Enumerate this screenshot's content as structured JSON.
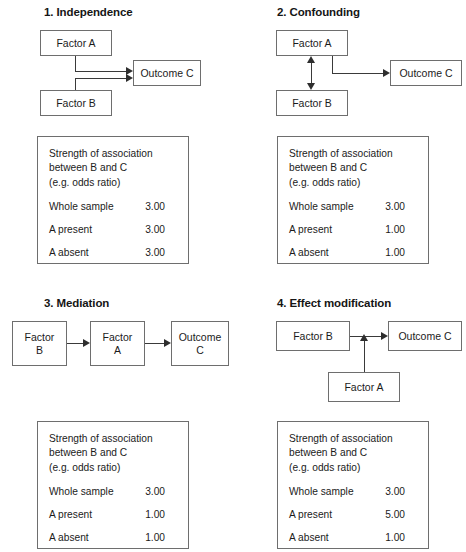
{
  "figure": {
    "panels": [
      {
        "title": "1. Independence",
        "nodes": {
          "factor_a": "Factor A",
          "factor_b": "Factor B",
          "outcome_c": "Outcome C"
        },
        "table": {
          "heading": "Strength of association\nbetween B and C\n(e.g. odds ratio)",
          "rows": [
            {
              "label": "Whole sample",
              "value": "3.00"
            },
            {
              "label": "A present",
              "value": "3.00"
            },
            {
              "label": "A absent",
              "value": "3.00"
            }
          ]
        }
      },
      {
        "title": "2. Confounding",
        "nodes": {
          "factor_a": "Factor A",
          "factor_b": "Factor B",
          "outcome_c": "Outcome C"
        },
        "table": {
          "heading": "Strength of association\nbetween B and C\n(e.g. odds ratio)",
          "rows": [
            {
              "label": "Whole sample",
              "value": "3.00"
            },
            {
              "label": "A present",
              "value": "1.00"
            },
            {
              "label": "A absent",
              "value": "1.00"
            }
          ]
        }
      },
      {
        "title": "3. Mediation",
        "nodes": {
          "factor_b_line1": "Factor",
          "factor_b_line2": "B",
          "factor_a_line1": "Factor",
          "factor_a_line2": "A",
          "outcome_c_line1": "Outcome",
          "outcome_c_line2": "C"
        },
        "table": {
          "heading": "Strength of association\nbetween B and C\n(e.g. odds ratio)",
          "rows": [
            {
              "label": "Whole sample",
              "value": "3.00"
            },
            {
              "label": "A present",
              "value": "1.00"
            },
            {
              "label": "A absent",
              "value": "1.00"
            }
          ]
        }
      },
      {
        "title": "4. Effect modification",
        "nodes": {
          "factor_b": "Factor B",
          "factor_a": "Factor A",
          "outcome_c": "Outcome C"
        },
        "table": {
          "heading": "Strength of association\nbetween B and C\n(e.g. odds ratio)",
          "rows": [
            {
              "label": "Whole sample",
              "value": "3.00"
            },
            {
              "label": "A present",
              "value": "5.00"
            },
            {
              "label": "A absent",
              "value": "1.00"
            }
          ]
        }
      }
    ],
    "colors": {
      "box_border": "#6e6e6e",
      "arrow": "#2e2e2e",
      "text": "#1b1b1b",
      "background": "#ffffff"
    }
  }
}
